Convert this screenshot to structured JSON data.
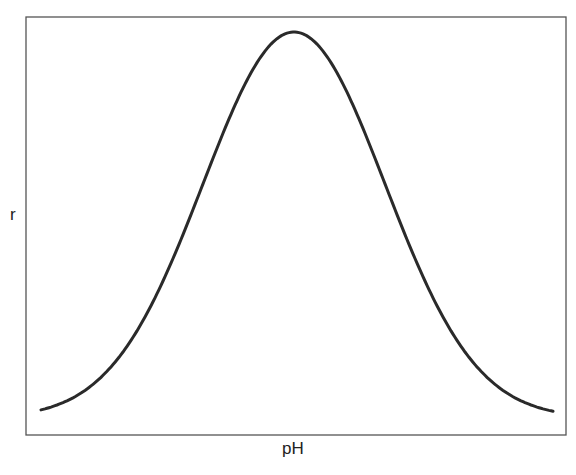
{
  "chart_data": {
    "type": "line",
    "title": "",
    "xlabel": "pH",
    "ylabel": "r",
    "grid": false,
    "legend": null,
    "x_ticks": [],
    "y_ticks": [],
    "series": [
      {
        "name": "r vs pH",
        "color": "#2a2a2a",
        "x": [
          0.0,
          0.1,
          0.2,
          0.3,
          0.4,
          0.5,
          0.6,
          0.7,
          0.8,
          0.9,
          1.0
        ],
        "y": [
          0.03,
          0.1,
          0.28,
          0.58,
          0.88,
          1.0,
          0.88,
          0.58,
          0.28,
          0.1,
          0.04
        ]
      }
    ],
    "xlim": [
      0,
      1
    ],
    "ylim": [
      0,
      1.05
    ]
  },
  "frame": {
    "left": 26,
    "top": 17,
    "right": 566,
    "bottom": 435,
    "color": "#555555"
  },
  "curve": {
    "center_px": 294,
    "sigma_px": 91,
    "peak_y_px": 32,
    "base_y_px": 418,
    "x_start_px": 41,
    "x_end_px": 553,
    "color": "#2a2a2a"
  }
}
